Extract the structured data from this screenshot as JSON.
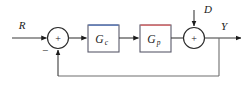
{
  "diagram": {
    "type": "control-system-block-diagram",
    "background_color": "#ffffff",
    "line_color": "#3b3b3b",
    "signals": {
      "reference": {
        "label": "R",
        "name": "reference-input",
        "x": 22,
        "y": 29
      },
      "disturbance": {
        "label": "D",
        "name": "disturbance-input",
        "x": 204,
        "y": 13
      },
      "output": {
        "label": "Y",
        "name": "output-signal",
        "x": 224,
        "y": 29
      }
    },
    "summing_junctions": [
      {
        "name": "error-summing-junction",
        "cx": 58,
        "cy": 38,
        "r": 10.5,
        "signs": [
          {
            "symbol": "+",
            "name": "plus-sign-left-junction",
            "x": 58,
            "y": 41.5
          },
          {
            "symbol": "−",
            "name": "minus-sign-left-junction",
            "x": 45,
            "y": 54
          }
        ]
      },
      {
        "name": "disturbance-summing-junction",
        "cx": 194,
        "cy": 38,
        "r": 10.5,
        "signs": [
          {
            "symbol": "+",
            "name": "plus-sign-right-junction",
            "x": 194,
            "y": 41.5
          }
        ]
      }
    ],
    "blocks": [
      {
        "name": "controller-block",
        "label": "G",
        "subscript": "c",
        "x": 88,
        "y": 25,
        "width": 31,
        "height": 27,
        "border_color": "#5a5a6b",
        "accent_color": "#5577bb",
        "accent_edge": "top"
      },
      {
        "name": "plant-block",
        "label": "G",
        "subscript": "p",
        "x": 140,
        "y": 25,
        "width": 31,
        "height": 27,
        "border_color": "#9a7a8a",
        "accent_color": "#e06666",
        "accent_edge": "top"
      }
    ],
    "main_line_y": 38,
    "feedback_line_y": 76,
    "feedback_tap_x": 219
  }
}
